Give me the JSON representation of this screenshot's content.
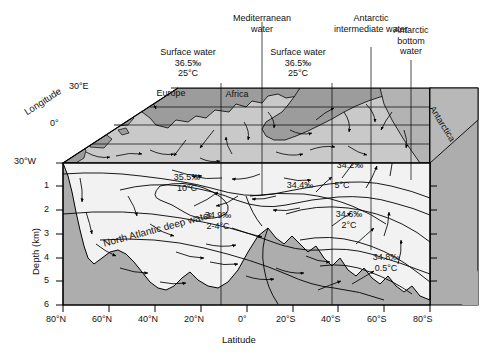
{
  "figure": {
    "type": "block-diagram",
    "x_axis": {
      "label": "Latitude",
      "ticks": [
        "80°N",
        "60°N",
        "40°N",
        "20°N",
        "0°",
        "20°S",
        "40°S",
        "60°S",
        "80°S"
      ]
    },
    "y_axis": {
      "label": "Depth (km)",
      "ticks": [
        "1",
        "2",
        "3",
        "4",
        "5",
        "6"
      ]
    },
    "z_axis": {
      "label": "Longitude",
      "ticks": [
        "30°E",
        "0°",
        "30°W"
      ]
    }
  },
  "callouts": [
    {
      "name": "surface-water-north",
      "text": "Surface water\n36.5‰\n25°C"
    },
    {
      "name": "mediterranean-water",
      "text": "Mediterranean\nwater"
    },
    {
      "name": "surface-water-south",
      "text": "Surface water\n36.5‰\n25°C"
    },
    {
      "name": "antarctic-intermediate-water",
      "text": "Antarctic\nintermediate water"
    },
    {
      "name": "antarctic-bottom-water",
      "text": "Antarctic\nbottom\nwater"
    }
  ],
  "map_labels": [
    {
      "name": "europe",
      "text": "Europe"
    },
    {
      "name": "africa",
      "text": "Africa"
    },
    {
      "name": "antarctica",
      "text": "Antarctica"
    }
  ],
  "water_mass_labels": [
    {
      "name": "mediterranean-core",
      "text": "35.5‰\n10°C"
    },
    {
      "name": "north-atlantic-deep-water-props",
      "text": "34.9‰\n2-4°C"
    },
    {
      "name": "north-atlantic-deep-water",
      "text": "North Atlantic deep water"
    },
    {
      "name": "aaiw-salinity",
      "text": "34.2‰"
    },
    {
      "name": "subantarctic-surface",
      "text": "34.4‰"
    },
    {
      "name": "aaiw-temp",
      "text": "5°C"
    },
    {
      "name": "circumpolar-deep",
      "text": "34.6‰\n2°C"
    },
    {
      "name": "antarctic-bottom-props",
      "text": "34.8‰\n0.5°C"
    }
  ],
  "colors": {
    "land": "#9c9c9c",
    "ocean_surface": "#c9c9c9",
    "side_face": "#adadad",
    "water_body": "#f2f2f2",
    "stroke": "#000000"
  }
}
